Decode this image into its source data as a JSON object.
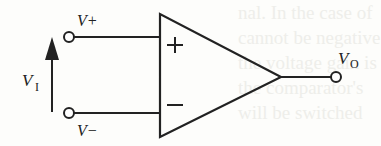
{
  "diagram": {
    "type": "op-amp comparator symbol",
    "labels": {
      "v_plus": "V+",
      "v_minus": "V−",
      "v_in_main": "V",
      "v_in_sub": "I",
      "v_out_main": "V",
      "v_out_sub": "O"
    },
    "inputs": {
      "plus_sign": "+",
      "minus_sign": "−"
    },
    "colors": {
      "stroke": "#222222",
      "background": "#fdfdfb"
    }
  },
  "background_text": [
    "nal. In the case of",
    "cannot be negative",
    "the voltage gain is",
    "the comparator's",
    "will be switched"
  ]
}
